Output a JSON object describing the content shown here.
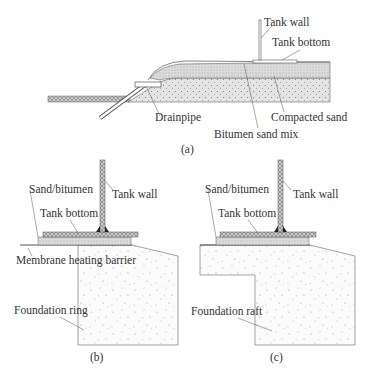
{
  "panel_a": {
    "caption": "(a)",
    "labels": {
      "tank_wall": "Tank wall",
      "tank_bottom": "Tank bottom",
      "drainpipe": "Drainpipe",
      "compacted_sand": "Compacted sand",
      "bitumen_sand_mix": "Bitumen sand mix"
    }
  },
  "panel_b": {
    "caption": "(b)",
    "labels": {
      "sand_bitumen": "Sand/bitumen",
      "tank_wall": "Tank wall",
      "tank_bottom": "Tank bottom",
      "membrane": "Membrane heating barrier",
      "foundation": "Foundation ring"
    }
  },
  "panel_c": {
    "caption": "(c)",
    "labels": {
      "sand_bitumen": "Sand/bitumen",
      "tank_wall": "Tank wall",
      "tank_bottom": "Tank bottom",
      "foundation": "Foundation raft"
    }
  },
  "colors": {
    "line": "#555555",
    "hatch_fill": "#d8d8d8",
    "sand_fill": "#e6e6e6",
    "weld": "#222222"
  }
}
